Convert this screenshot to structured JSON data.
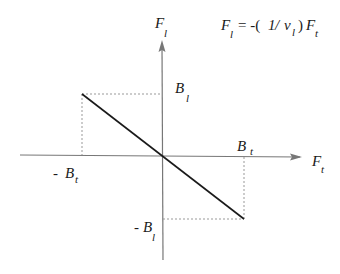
{
  "diagram": {
    "type": "force-relation-plot",
    "colors": {
      "axis": "#777777",
      "line": "#1a1a1a",
      "guide": "#999999",
      "text": "#1a1a1a"
    },
    "equation": {
      "lhs_main": "F",
      "lhs_sub": "l",
      "middle": "=  -(",
      "one": "1",
      "slash": "/ ",
      "nu": "ν",
      "nu_sub": "l",
      "close": ")",
      "rhs_main": "F",
      "rhs_sub": "t"
    },
    "axes": {
      "x": {
        "main": "F",
        "sub": "t"
      },
      "y": {
        "main": "F",
        "sub": "l"
      }
    },
    "ticks": {
      "pos_x": {
        "main": "B",
        "sub": "t"
      },
      "neg_x": {
        "prefix": "- ",
        "main": "B",
        "sub": "t"
      },
      "pos_y": {
        "main": "B",
        "sub": "l"
      },
      "neg_y": {
        "prefix": "- ",
        "main": "B",
        "sub": "l"
      }
    },
    "line": {
      "description": "Straight line through origin with negative slope, from (-Bt, Bl) to (Bt, -Bl)"
    }
  }
}
